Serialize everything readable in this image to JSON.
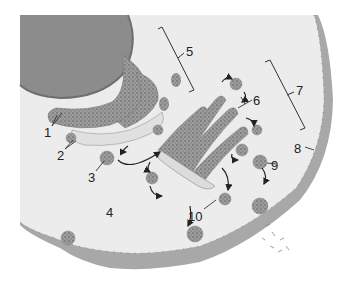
{
  "diagram": {
    "type": "cell-secretory-pathway-illustration",
    "colors": {
      "cytoplasm": "#ececec",
      "membrane_band": "#a8a8a8",
      "nucleus": "#8c8c8c",
      "organelle": "#9a9a9a",
      "organelle_light": "#d8d8d8",
      "arrow": "#222222",
      "label_text": "#222222"
    },
    "labels": [
      {
        "id": "1",
        "text": "1",
        "x": 44,
        "y": 126
      },
      {
        "id": "2",
        "text": "2",
        "x": 57,
        "y": 149
      },
      {
        "id": "3",
        "text": "3",
        "x": 88,
        "y": 171
      },
      {
        "id": "4",
        "text": "4",
        "x": 106,
        "y": 206
      },
      {
        "id": "5",
        "text": "5",
        "x": 186,
        "y": 45
      },
      {
        "id": "6",
        "text": "6",
        "x": 253,
        "y": 94
      },
      {
        "id": "7",
        "text": "7",
        "x": 296,
        "y": 84
      },
      {
        "id": "8",
        "text": "8",
        "x": 294,
        "y": 142
      },
      {
        "id": "9",
        "text": "9",
        "x": 271,
        "y": 159
      },
      {
        "id": "10",
        "text": "10",
        "x": 188,
        "y": 210
      }
    ]
  }
}
